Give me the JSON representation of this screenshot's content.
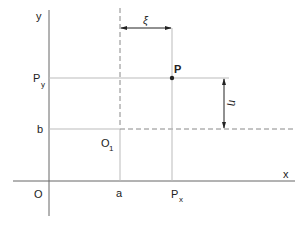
{
  "diagram": {
    "axes": {
      "x_label": "x",
      "y_label": "y",
      "origin_label": "O"
    },
    "translated_origin": {
      "label": "O",
      "subscript": "1"
    },
    "offsets": {
      "a_label": "a",
      "b_label": "b"
    },
    "point": {
      "label": "P",
      "px_label": "P",
      "px_subscript": "x",
      "py_label": "P",
      "py_subscript": "y"
    },
    "local_coords": {
      "xi_label": "ξ",
      "eta_label": "η"
    },
    "colors": {
      "axis": "#555555",
      "guide": "#aaaaaa",
      "dashed": "#888888",
      "arrow": "#222222",
      "point": "#222222"
    }
  }
}
